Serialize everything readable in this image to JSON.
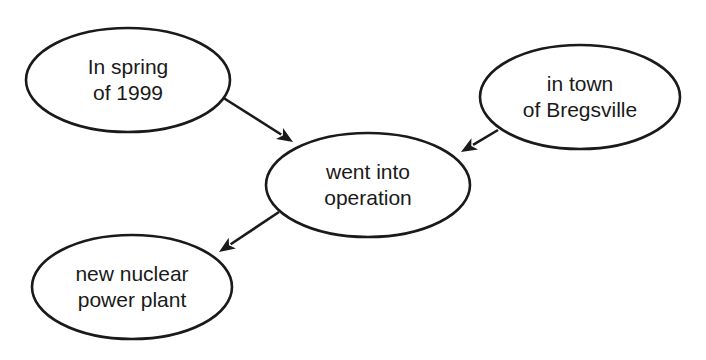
{
  "diagram": {
    "type": "concept-graph",
    "colors": {
      "background": "#ffffff",
      "stroke": "#1a1a1a",
      "text": "#1a1a1a"
    },
    "nodes": [
      {
        "id": "time",
        "lines": [
          "In spring",
          "of 1999"
        ],
        "cx": 128,
        "cy": 80,
        "rx": 102,
        "ry": 52
      },
      {
        "id": "location",
        "lines": [
          "in town",
          "of Bregsville"
        ],
        "cx": 580,
        "cy": 97,
        "rx": 100,
        "ry": 52
      },
      {
        "id": "event",
        "lines": [
          "went into",
          "operation"
        ],
        "cx": 368,
        "cy": 185,
        "rx": 102,
        "ry": 52
      },
      {
        "id": "subject",
        "lines": [
          "new nuclear",
          "power plant"
        ],
        "cx": 132,
        "cy": 287,
        "rx": 100,
        "ry": 52
      }
    ],
    "edges": [
      {
        "from": "time",
        "to": "event",
        "x1": 222,
        "y1": 97,
        "x2": 293,
        "y2": 142
      },
      {
        "from": "location",
        "to": "event",
        "x1": 498,
        "y1": 130,
        "x2": 461,
        "y2": 152
      },
      {
        "from": "event",
        "to": "subject",
        "x1": 279,
        "y1": 212,
        "x2": 219,
        "y2": 252
      }
    ]
  }
}
